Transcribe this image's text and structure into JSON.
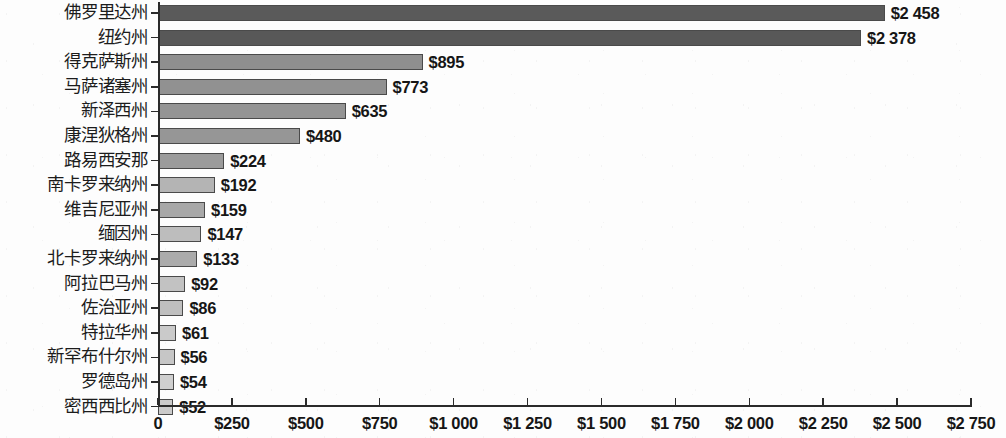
{
  "chart_data": {
    "type": "bar",
    "orientation": "horizontal",
    "title": "",
    "subtitle": "",
    "xlabel": "",
    "ylabel": "",
    "xlim": [
      0,
      2750
    ],
    "xtick_step": 250,
    "grid": false,
    "legend": null,
    "currency_symbol": "$",
    "thousands_separator": " ",
    "categories": [
      "佛罗里达州",
      "纽约州",
      "得克萨斯州",
      "马萨诸塞州",
      "新泽西州",
      "康涅狄格州",
      "路易西安那",
      "南卡罗来纳州",
      "维吉尼亚州",
      "缅因州",
      "北卡罗来纳州",
      "阿拉巴马州",
      "佐治亚州",
      "特拉华州",
      "新罕布什尔州",
      "罗德岛州",
      "密西西比州"
    ],
    "values": [
      2458,
      2378,
      895,
      773,
      635,
      480,
      224,
      192,
      159,
      147,
      133,
      92,
      86,
      61,
      56,
      54,
      52
    ],
    "value_labels": [
      "$2 458",
      "$2 378",
      "$895",
      "$773",
      "$635",
      "$480",
      "$224",
      "$192",
      "$159",
      "$147",
      "$133",
      "$92",
      "$86",
      "$61",
      "$56",
      "$54",
      "$52"
    ],
    "bar_colors": [
      "#5a5a5a",
      "#585858",
      "#8f8f8f",
      "#919191",
      "#949494",
      "#969696",
      "#9b9b9b",
      "#b4b4b4",
      "#a8a8a8",
      "#bdbdbd",
      "#ababab",
      "#c2c2c2",
      "#bfbfbf",
      "#cacaca",
      "#c6c6c6",
      "#cfcfcf",
      "#cbcbcb"
    ],
    "xtick_labels": [
      "0",
      "$250",
      "$500",
      "$750",
      "$1 000",
      "$1 250",
      "$1 500",
      "$1 750",
      "$2 000",
      "$2 250",
      "$2 500",
      "$2 750"
    ],
    "xtick_values": [
      0,
      250,
      500,
      750,
      1000,
      1250,
      1500,
      1750,
      2000,
      2250,
      2500,
      2750
    ],
    "axis_color": "#2b2b2b",
    "background_color": "#fdfdfd",
    "label_text_color": "#1c1c1c"
  }
}
